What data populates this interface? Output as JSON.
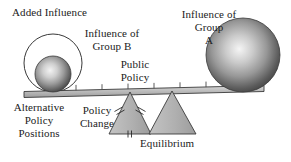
{
  "diagram": {
    "title_present": false,
    "type": "seesaw-lever-policy-equilibrium-diagram",
    "background_color": "#ffffff",
    "ink_color": "#222222",
    "labels": {
      "added_influence": "Added Influence",
      "influence_group_b": "Influence of\nGroup B",
      "public_policy": "Public\nPolicy",
      "influence_group_a": "Influence of\nGroup\nA",
      "alternative_policy_positions": "Alternative\nPolicy\nPositions",
      "policy_change": "Policy\nChange",
      "equilibrium": "Equilibrium"
    },
    "elements": {
      "outline_circle": {
        "name": "added-influence-circle",
        "cx": 53,
        "cy": 63,
        "r": 29,
        "fill": "none",
        "stroke": "#333333",
        "stroke_width": 1
      },
      "sphere_b": {
        "name": "group-b-sphere",
        "cx": 53,
        "cy": 74,
        "r": 18,
        "fill_light": "#efefef",
        "fill_mid": "#9a9a9a",
        "fill_dark": "#4a4a4a",
        "stroke": "#3a3a3a"
      },
      "sphere_a": {
        "name": "group-a-sphere",
        "cx": 243,
        "cy": 57,
        "r": 37,
        "fill_light": "#f2f2f2",
        "fill_mid": "#979797",
        "fill_dark": "#434343",
        "stroke": "#3a3a3a"
      },
      "beam": {
        "name": "public-policy-beam",
        "x1": 25,
        "y1": 94,
        "x2": 263,
        "y2": 88,
        "thickness": 6,
        "fill": "#b9b9b9",
        "stroke": "#3a3a3a",
        "tick_count": 9,
        "tick_length": 6,
        "tick_color": "#4a4a4a"
      },
      "triangle_policy_change": {
        "name": "policy-change-fulcrum",
        "apex_x": 130,
        "apex_y": 92,
        "base_left_x": 109,
        "base_right_x": 151,
        "base_y": 134,
        "fill": "#b2b2b2",
        "stroke": "#3a3a3a",
        "hash_marks": [
          "left-side-double",
          "right-side-double",
          "base-double"
        ]
      },
      "triangle_equilibrium": {
        "name": "equilibrium-fulcrum",
        "apex_x": 172,
        "apex_y": 91,
        "base_left_x": 149,
        "base_right_x": 196,
        "base_y": 134,
        "fill": "#b2b2b2",
        "stroke": "#3a3a3a",
        "hash_marks": []
      }
    }
  }
}
